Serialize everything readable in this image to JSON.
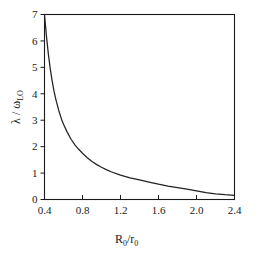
{
  "chart_data": {
    "type": "line",
    "title": "",
    "subtitle": "",
    "xlabel": "R0/r0",
    "xlabel_parts": {
      "main1": "R",
      "sub1": "0",
      "slash": "/",
      "main2": "r",
      "sub2": "0"
    },
    "ylabel": "λ / ωLO",
    "ylabel_parts": {
      "lambda": "λ",
      "slash": " / ",
      "omega": "ω",
      "sub": "LO"
    },
    "xlim": [
      0.4,
      2.4
    ],
    "ylim": [
      0,
      7
    ],
    "xticks": [
      "0.4",
      "0.8",
      "1.2",
      "1.6",
      "2.0",
      "2.4"
    ],
    "xtick_values": [
      0.4,
      0.8,
      1.2,
      1.6,
      2.0,
      2.4
    ],
    "yticks": [
      "0",
      "1",
      "2",
      "3",
      "4",
      "5",
      "6",
      "7"
    ],
    "ytick_values": [
      0,
      1,
      2,
      3,
      4,
      5,
      6,
      7
    ],
    "grid": false,
    "legend": null,
    "legend_position": "none",
    "series": [
      {
        "name": "lambda over omega LO",
        "color": "#222222",
        "x": [
          0.4,
          0.42,
          0.44,
          0.46,
          0.48,
          0.5,
          0.52,
          0.55,
          0.58,
          0.6,
          0.64,
          0.68,
          0.72,
          0.76,
          0.8,
          0.85,
          0.9,
          0.95,
          1.0,
          1.05,
          1.1,
          1.2,
          1.3,
          1.4,
          1.5,
          1.6,
          1.7,
          1.8,
          1.9,
          2.0,
          2.1,
          2.2,
          2.3,
          2.4
        ],
        "values": [
          7.0,
          6.2,
          5.52,
          4.96,
          4.5,
          4.1,
          3.78,
          3.37,
          3.03,
          2.85,
          2.54,
          2.28,
          2.07,
          1.9,
          1.75,
          1.58,
          1.44,
          1.32,
          1.22,
          1.13,
          1.05,
          0.92,
          0.82,
          0.74,
          0.66,
          0.58,
          0.51,
          0.45,
          0.39,
          0.33,
          0.26,
          0.21,
          0.18,
          0.16
        ]
      }
    ],
    "colors": {
      "curve": "#222222",
      "frame": "#1a1a1a",
      "background": "#ffffff"
    }
  }
}
